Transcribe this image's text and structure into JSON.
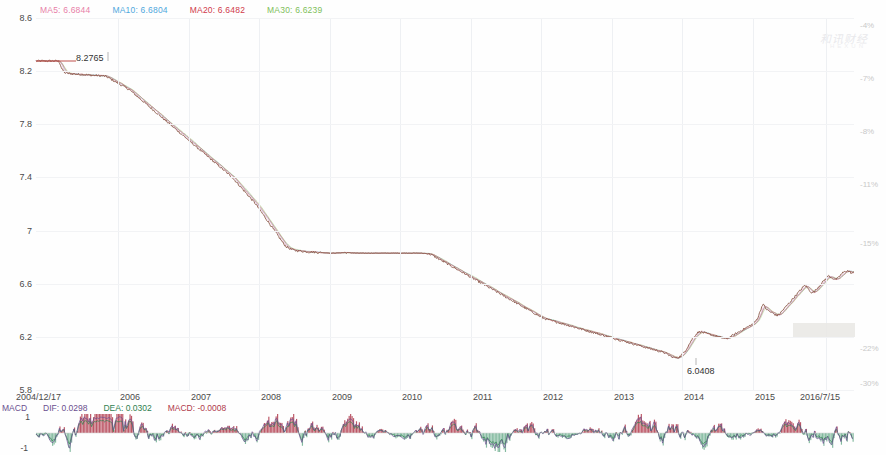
{
  "legend": {
    "ma5": {
      "label": "MA5: 6.6844",
      "color": "#e87fa8"
    },
    "ma10": {
      "label": "MA10: 6.6804",
      "color": "#4fa8dd"
    },
    "ma20": {
      "label": "MA20: 6.6482",
      "color": "#d03a4b"
    },
    "ma30": {
      "label": "MA30: 6.6239",
      "color": "#7fbf5a"
    }
  },
  "macd_legend": {
    "title": "MACD",
    "dif": {
      "label": "DIF: 0.0298",
      "color": "#6a4f8f"
    },
    "dea": {
      "label": "DEA: 0.0302",
      "color": "#2f7f4f"
    },
    "macd": {
      "label": "MACD: -0.0008",
      "color": "#b03a4b"
    }
  },
  "annotations": {
    "high": "8.2765",
    "low": "6.0408"
  },
  "watermark": {
    "text": "和讯财经",
    "sub": "HEXUN"
  },
  "chart_data": {
    "type": "line",
    "title": "",
    "xlabel": "",
    "ylabel": "",
    "ylim": [
      5.8,
      8.6
    ],
    "yticks": [
      8.6,
      8.2,
      7.8,
      7.4,
      7,
      6.6,
      6.2,
      5.8
    ],
    "ytick_labels": [
      "8.6",
      "8.2",
      "7.8",
      "7.4",
      "7",
      "6.6",
      "6.2",
      "5.8"
    ],
    "right_axis_label": "percent change",
    "right_ticks": [
      -4,
      -7,
      -8,
      -11,
      -15,
      -22,
      -30
    ],
    "right_tick_labels": [
      "-4%",
      "-7%",
      "-8%",
      "-11%",
      "-15%",
      "-22%",
      "-30%"
    ],
    "xtick_labels": [
      "2004/12/17",
      "2006",
      "2007",
      "2008",
      "2009",
      "2010",
      "2011",
      "2012",
      "2013",
      "2014",
      "2015",
      "2016/7/15"
    ],
    "grid": true,
    "legend_position": "top-left",
    "series": [
      {
        "name": "Price",
        "color": "#8b5a4a",
        "values": [
          8.2765,
          8.2765,
          8.2765,
          8.2765,
          8.276,
          8.2765,
          8.2765,
          8.2765,
          8.2765,
          8.2765,
          8.27,
          8.22,
          8.19,
          8.185,
          8.182,
          8.18,
          8.179,
          8.178,
          8.176,
          8.175,
          8.174,
          8.173,
          8.172,
          8.17,
          8.169,
          8.168,
          8.167,
          8.166,
          8.165,
          8.164,
          8.16,
          8.15,
          8.14,
          8.13,
          8.12,
          8.11,
          8.1,
          8.09,
          8.08,
          8.07,
          8.06,
          8.045,
          8.03,
          8.015,
          8.0,
          7.985,
          7.97,
          7.955,
          7.94,
          7.925,
          7.91,
          7.895,
          7.88,
          7.865,
          7.85,
          7.835,
          7.82,
          7.805,
          7.79,
          7.775,
          7.76,
          7.745,
          7.73,
          7.715,
          7.7,
          7.685,
          7.67,
          7.655,
          7.64,
          7.625,
          7.61,
          7.595,
          7.58,
          7.565,
          7.55,
          7.535,
          7.52,
          7.505,
          7.49,
          7.475,
          7.46,
          7.445,
          7.43,
          7.415,
          7.4,
          7.38,
          7.36,
          7.34,
          7.32,
          7.3,
          7.28,
          7.26,
          7.24,
          7.22,
          7.2,
          7.175,
          7.15,
          7.125,
          7.1,
          7.075,
          7.05,
          7.025,
          7.0,
          6.975,
          6.95,
          6.925,
          6.9,
          6.88,
          6.87,
          6.86,
          6.855,
          6.85,
          6.848,
          6.846,
          6.844,
          6.842,
          6.84,
          6.839,
          6.838,
          6.837,
          6.836,
          6.835,
          6.834,
          6.833,
          6.832,
          6.831,
          6.83,
          6.83,
          6.831,
          6.832,
          6.833,
          6.834,
          6.835,
          6.834,
          6.833,
          6.832,
          6.831,
          6.83,
          6.83,
          6.83,
          6.83,
          6.83,
          6.83,
          6.83,
          6.83,
          6.83,
          6.83,
          6.83,
          6.83,
          6.83,
          6.83,
          6.83,
          6.83,
          6.83,
          6.83,
          6.83,
          6.83,
          6.83,
          6.83,
          6.83,
          6.83,
          6.83,
          6.83,
          6.83,
          6.83,
          6.829,
          6.828,
          6.827,
          6.825,
          6.82,
          6.81,
          6.8,
          6.79,
          6.78,
          6.77,
          6.76,
          6.75,
          6.74,
          6.73,
          6.72,
          6.71,
          6.7,
          6.69,
          6.68,
          6.67,
          6.66,
          6.65,
          6.64,
          6.63,
          6.62,
          6.61,
          6.6,
          6.59,
          6.58,
          6.57,
          6.56,
          6.55,
          6.54,
          6.53,
          6.52,
          6.51,
          6.5,
          6.49,
          6.48,
          6.47,
          6.46,
          6.45,
          6.44,
          6.43,
          6.42,
          6.41,
          6.4,
          6.39,
          6.38,
          6.37,
          6.36,
          6.35,
          6.34,
          6.335,
          6.33,
          6.325,
          6.32,
          6.315,
          6.31,
          6.305,
          6.3,
          6.295,
          6.29,
          6.285,
          6.28,
          6.275,
          6.27,
          6.265,
          6.26,
          6.255,
          6.25,
          6.245,
          6.24,
          6.235,
          6.23,
          6.225,
          6.22,
          6.215,
          6.21,
          6.205,
          6.2,
          6.195,
          6.19,
          6.185,
          6.18,
          6.175,
          6.17,
          6.165,
          6.16,
          6.155,
          6.15,
          6.145,
          6.14,
          6.135,
          6.13,
          6.125,
          6.12,
          6.115,
          6.11,
          6.105,
          6.1,
          6.095,
          6.09,
          6.085,
          6.08,
          6.07,
          6.06,
          6.05,
          6.045,
          6.0408,
          6.045,
          6.06,
          6.08,
          6.1,
          6.13,
          6.16,
          6.19,
          6.21,
          6.23,
          6.24,
          6.235,
          6.23,
          6.225,
          6.22,
          6.215,
          6.21,
          6.205,
          6.2,
          6.195,
          6.19,
          6.185,
          6.19,
          6.2,
          6.21,
          6.22,
          6.23,
          6.24,
          6.25,
          6.26,
          6.27,
          6.28,
          6.29,
          6.3,
          6.32,
          6.35,
          6.4,
          6.45,
          6.42,
          6.4,
          6.39,
          6.38,
          6.37,
          6.36,
          6.37,
          6.39,
          6.41,
          6.43,
          6.45,
          6.47,
          6.49,
          6.51,
          6.53,
          6.55,
          6.57,
          6.59,
          6.57,
          6.55,
          6.53,
          6.54,
          6.56,
          6.58,
          6.6,
          6.62,
          6.64,
          6.66,
          6.65,
          6.64,
          6.63,
          6.64,
          6.66,
          6.68,
          6.69,
          6.7,
          6.69,
          6.68,
          6.6844
        ]
      }
    ],
    "macd": {
      "type": "bar",
      "ylim": [
        -1,
        1
      ],
      "yticks": [
        1,
        -1
      ],
      "ytick_labels": [
        "1",
        "-1"
      ],
      "dif_color": "#6a4f8f",
      "dea_color": "#2f7f4f",
      "bar_up_color": "#b03a4b",
      "bar_down_color": "#6fae8f"
    }
  }
}
